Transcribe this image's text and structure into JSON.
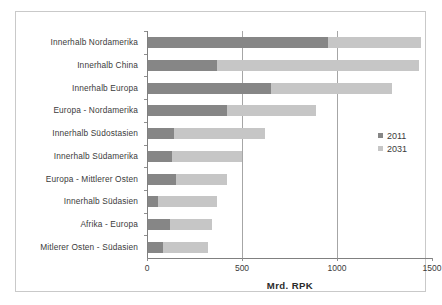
{
  "chart_data": {
    "type": "bar",
    "orientation": "horizontal",
    "stacked": true,
    "title": "",
    "xlabel": "Mrd. RPK",
    "ylabel": "",
    "xlim": [
      0,
      1500
    ],
    "xticks": [
      0,
      500,
      1000,
      1500
    ],
    "xtick_labels": [
      "0",
      "500",
      "1000",
      "1500"
    ],
    "grid": "vertical gridlines at 500 and 1000",
    "legend_position": "right",
    "categories": [
      "Innerhalb Nordamerika",
      "Innerhalb China",
      "Innerhalb Europa",
      "Europa - Nordamerika",
      "Innerhalb Südostasien",
      "Innerhalb Südamerika",
      "Europa - Mittlerer Osten",
      "Innerhalb Südasien",
      "Afrika - Europa",
      "Mitlerer Osten - Südasien"
    ],
    "series": [
      {
        "name": "2011",
        "color": "#868686",
        "values": [
          950,
          370,
          650,
          420,
          140,
          130,
          150,
          60,
          120,
          85
        ]
      },
      {
        "name": "2031",
        "color": "#c6c6c6",
        "values": [
          490,
          1060,
          640,
          470,
          480,
          370,
          270,
          310,
          220,
          235
        ]
      }
    ],
    "totals": [
      1440,
      1430,
      1290,
      890,
      620,
      500,
      420,
      370,
      340,
      320
    ]
  },
  "legend": {
    "entries": [
      {
        "label": "2011",
        "color": "#868686"
      },
      {
        "label": "2031",
        "color": "#c6c6c6"
      }
    ]
  },
  "axis": {
    "x_title": "Mrd. RPK",
    "x_tick_labels": [
      "0",
      "500",
      "1000",
      "1500"
    ]
  }
}
